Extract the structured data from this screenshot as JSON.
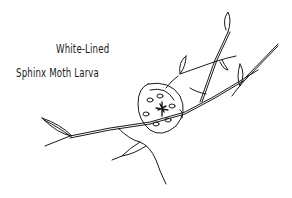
{
  "illustration": {
    "caption_line1": "White-Lined",
    "caption_line2": "Sphinx Moth Larva",
    "subject": "caterpillar curled on branch",
    "ink_color": "#1a1a1a",
    "background": "#ffffff"
  }
}
